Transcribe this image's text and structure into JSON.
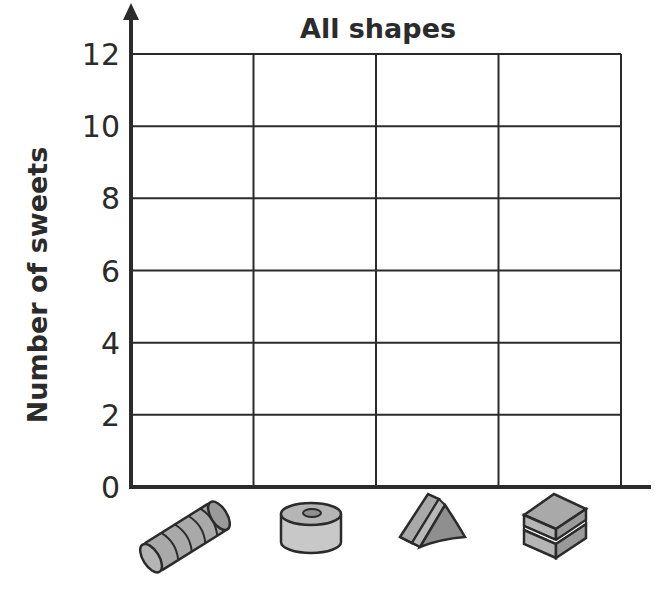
{
  "chart_data": {
    "type": "bar",
    "title": "All shapes",
    "xlabel": "",
    "ylabel": "Number of sweets",
    "categories": [
      "cylinder sweet",
      "ring sweet",
      "triangular prism sweet",
      "layered cube sweet"
    ],
    "category_icons": [
      "cylinder-sweet-icon",
      "ring-sweet-icon",
      "triangle-prism-sweet-icon",
      "layered-cube-sweet-icon"
    ],
    "values": [
      null,
      null,
      null,
      null
    ],
    "ylim": [
      0,
      12
    ],
    "yticks": [
      0,
      2,
      4,
      6,
      8,
      10,
      12
    ],
    "ytick_labels": [
      "0",
      "2",
      "4",
      "6",
      "8",
      "10",
      "12"
    ],
    "grid": true,
    "legend": "none",
    "note": "Blank chart template — no bars drawn"
  },
  "colors": {
    "ink": "#2b2b2b",
    "shape_fill": "#a9a9a9",
    "shape_fill_light": "#c8c8c8",
    "shape_fill_dark": "#8f8f8f"
  }
}
